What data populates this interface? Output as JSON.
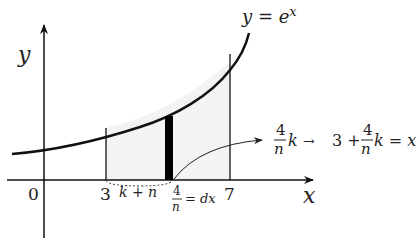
{
  "diagram": {
    "curve_label": "y = e",
    "curve_label_exponent": "x",
    "axes": {
      "x_label": "x",
      "y_label": "y",
      "origin_label": "0"
    },
    "ticks": {
      "lower": "3",
      "upper": "7"
    },
    "interval_label": "k + n",
    "width_label": {
      "numerator": "4",
      "denominator": "n",
      "rhs": "= dx"
    },
    "annotation": {
      "left_numerator": "4",
      "left_denominator": "n",
      "left_var": "k",
      "arrow": "→",
      "right_prefix": "3 +",
      "right_numerator": "4",
      "right_denominator": "n",
      "right_suffix": "k = x"
    },
    "colors": {
      "line": "#111111",
      "shade": "#f3f3f3",
      "strip": "#000000"
    }
  }
}
